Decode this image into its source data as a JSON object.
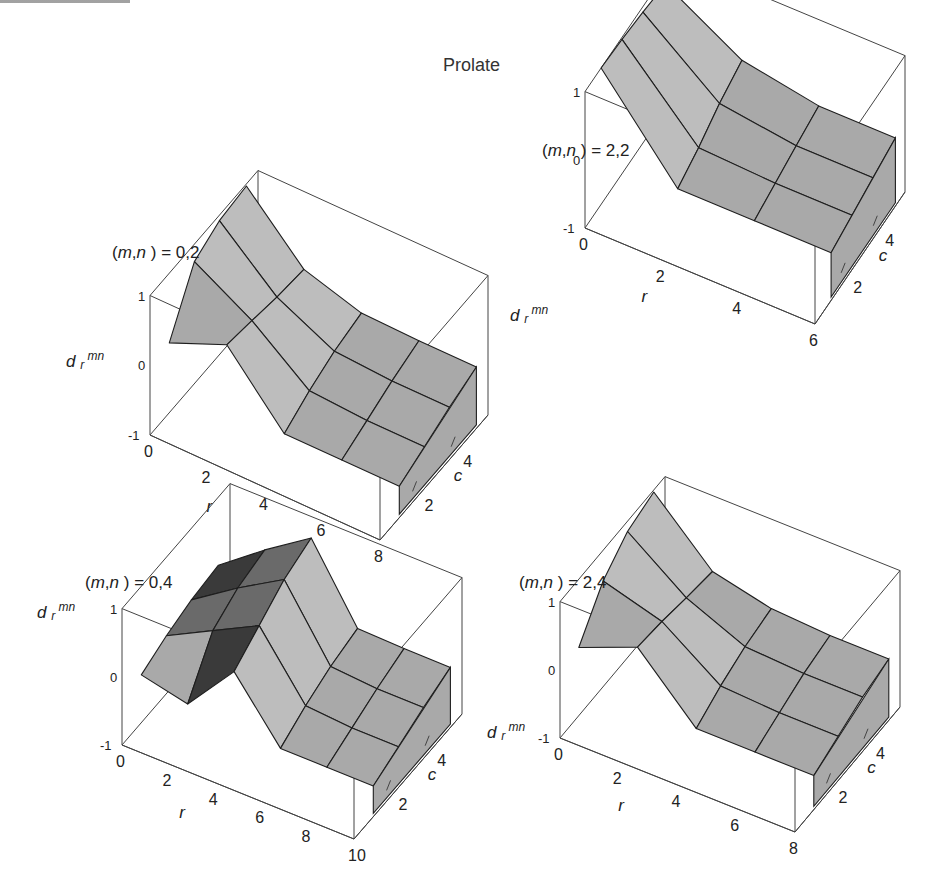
{
  "figure": {
    "title": "Prolate",
    "top_clipped_text": ""
  },
  "chart_data": [
    {
      "type": "surface3d",
      "panel_label": "(m,n) = 0,2",
      "label_m": "m",
      "label_n": "n",
      "label_value": "0,2",
      "zlabel": "d r mn",
      "xlabel": "r",
      "ylabel": "c",
      "x_ticks": [
        "0",
        "2",
        "4",
        "6",
        "8"
      ],
      "y_ticks": [
        "2",
        "4"
      ],
      "z_ticks": [
        "1",
        "0",
        "-1"
      ],
      "zlim": [
        -1,
        1
      ],
      "x": [
        0,
        2,
        4,
        6,
        8
      ],
      "y": [
        1,
        2.3,
        3.6,
        5
      ],
      "z": [
        [
          0.0,
          0.75,
          0.92,
          0.97
        ],
        [
          0.35,
          0.28,
          0.2,
          0.15
        ],
        [
          -0.55,
          -0.35,
          -0.2,
          -0.1
        ],
        [
          -0.55,
          -0.4,
          -0.25,
          -0.12
        ],
        [
          -0.55,
          -0.4,
          -0.25,
          -0.12
        ]
      ]
    },
    {
      "type": "surface3d",
      "panel_label": "(m,n) = 2,2",
      "label_m": "m",
      "label_n": "n",
      "label_value": "2,2",
      "zlabel": "d r mn",
      "xlabel": "r",
      "ylabel": "c",
      "x_ticks": [
        "0",
        "2",
        "4",
        "6"
      ],
      "y_ticks": [
        "2",
        "4"
      ],
      "z_ticks": [
        "1",
        "0",
        "-1"
      ],
      "zlim": [
        -1,
        1
      ],
      "x": [
        0,
        2,
        4,
        6
      ],
      "y": [
        1,
        2.3,
        3.6,
        5
      ],
      "z": [
        [
          1.0,
          0.97,
          0.92,
          0.85
        ],
        [
          -0.3,
          -0.15,
          0.05,
          0.2
        ],
        [
          -0.3,
          -0.2,
          -0.1,
          0.0
        ],
        [
          -0.3,
          -0.2,
          -0.1,
          0.0
        ]
      ]
    },
    {
      "type": "surface3d",
      "panel_label": "(m,n) = 0,4",
      "label_m": "m",
      "label_n": "n",
      "label_value": "0,4",
      "zlabel": "d r mn",
      "xlabel": "r",
      "ylabel": "c",
      "x_ticks": [
        "0",
        "2",
        "4",
        "6",
        "8",
        "10"
      ],
      "y_ticks": [
        "2",
        "4"
      ],
      "z_ticks": [
        "1",
        "0",
        "-1"
      ],
      "zlim": [
        -1,
        1
      ],
      "x": [
        0,
        2,
        4,
        6,
        8,
        10
      ],
      "y": [
        1,
        2.3,
        3.6,
        5
      ],
      "z": [
        [
          -0.3,
          -0.15,
          -0.05,
          0.0
        ],
        [
          -0.45,
          0.2,
          0.4,
          0.5
        ],
        [
          0.3,
          0.55,
          0.8,
          0.95
        ],
        [
          -0.55,
          -0.35,
          -0.2,
          -0.1
        ],
        [
          -0.55,
          -0.4,
          -0.25,
          -0.12
        ],
        [
          -0.55,
          -0.4,
          -0.25,
          -0.12
        ]
      ]
    },
    {
      "type": "surface3d",
      "panel_label": "(m,n) = 2,4",
      "label_m": "m",
      "label_n": "n",
      "label_value": "2,4",
      "zlabel": "d r mn",
      "xlabel": "r",
      "ylabel": "c",
      "x_ticks": [
        "0",
        "2",
        "4",
        "6",
        "8"
      ],
      "y_ticks": [
        "2",
        "4"
      ],
      "z_ticks": [
        "1",
        "0",
        "-1"
      ],
      "zlim": [
        -1,
        1
      ],
      "x": [
        0,
        2,
        4,
        6,
        8
      ],
      "y": [
        1,
        2.3,
        3.6,
        5
      ],
      "z": [
        [
          0.0,
          0.55,
          0.85,
          0.97
        ],
        [
          0.35,
          0.3,
          0.22,
          0.15
        ],
        [
          -0.5,
          -0.3,
          -0.15,
          -0.05
        ],
        [
          -0.5,
          -0.35,
          -0.2,
          -0.1
        ],
        [
          -0.5,
          -0.35,
          -0.2,
          -0.1
        ]
      ]
    }
  ],
  "panels_layout": [
    {
      "left": 30,
      "top": 110,
      "box": {
        "o": [
          120,
          325
        ],
        "xv": [
          230,
          105
        ],
        "yv": [
          108,
          -125
        ],
        "zh": 90
      },
      "label_pos": [
        82,
        148
      ],
      "zlabel_pos": [
        36,
        257
      ],
      "zlabel_side": "mid"
    },
    {
      "left": 500,
      "top": 110,
      "box": {
        "o": [
          85,
          118
        ],
        "xv": [
          230,
          96
        ],
        "yv": [
          90,
          -132
        ],
        "zh": 88
      },
      "label_pos": [
        42,
        46
      ],
      "zlabel_pos": [
        10,
        211
      ],
      "zlabel_side": "low"
    },
    {
      "left": 30,
      "top": 525,
      "box": {
        "o": [
          92,
          220
        ],
        "xv": [
          232,
          94
        ],
        "yv": [
          108,
          -125
        ],
        "zh": 88
      },
      "label_pos": [
        55,
        63
      ],
      "zlabel_pos": [
        7,
        93
      ],
      "zlabel_side": "top"
    },
    {
      "left": 500,
      "top": 525,
      "box": {
        "o": [
          60,
          213
        ],
        "xv": [
          235,
          94
        ],
        "yv": [
          105,
          -125
        ],
        "zh": 88
      },
      "label_pos": [
        19,
        63
      ],
      "zlabel_pos": [
        -13,
        213
      ],
      "zlabel_side": "low"
    }
  ],
  "colors": {
    "face_light": "#bdbdbd",
    "face_mid": "#a9a9a9",
    "face_dark": "#3a3a3a",
    "edge": "#1e1e1e",
    "box": "#444444"
  }
}
